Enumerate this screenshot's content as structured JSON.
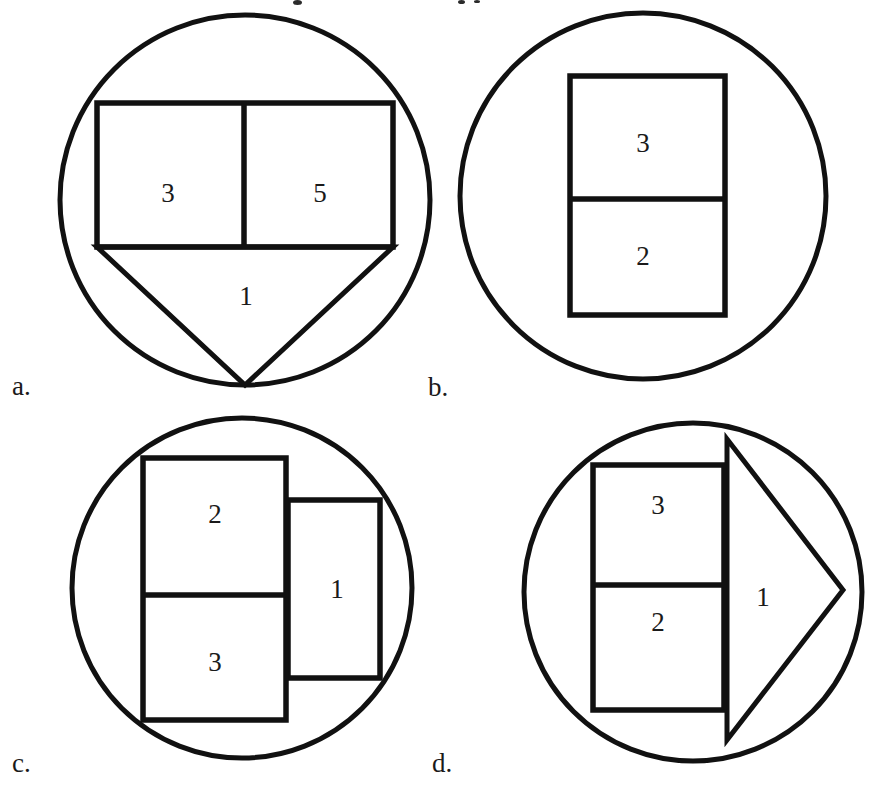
{
  "figure": {
    "background_color": "#ffffff",
    "stroke_color": "#111111",
    "text_color": "#1a1a1a"
  },
  "panels": [
    {
      "letter": "a.",
      "letter_pos": {
        "x": 12,
        "y": 395
      },
      "circle": {
        "cx": 245,
        "cy": 200,
        "r": 185
      },
      "shapes": [
        {
          "type": "rect",
          "x": 97,
          "y": 103,
          "w": 296,
          "h": 144
        },
        {
          "type": "vline",
          "x": 244,
          "y1": 103,
          "y2": 247
        },
        {
          "type": "triangle",
          "points": "97,247 393,247 245,385"
        }
      ],
      "regions": [
        {
          "label": "3",
          "x": 168,
          "y": 196
        },
        {
          "label": "5",
          "x": 320,
          "y": 196
        },
        {
          "label": "1",
          "x": 246,
          "y": 299
        }
      ]
    },
    {
      "letter": "b.",
      "letter_pos": {
        "x": 428,
        "y": 396
      },
      "circle": {
        "cx": 643,
        "cy": 196,
        "r": 183
      },
      "shapes": [
        {
          "type": "rect",
          "x": 570,
          "y": 76,
          "w": 155,
          "h": 239
        },
        {
          "type": "hline",
          "y": 199,
          "x1": 570,
          "x2": 725
        }
      ],
      "regions": [
        {
          "label": "3",
          "x": 643,
          "y": 146
        },
        {
          "label": "2",
          "x": 643,
          "y": 259
        }
      ]
    },
    {
      "letter": "c.",
      "letter_pos": {
        "x": 12,
        "y": 772
      },
      "circle": {
        "cx": 242,
        "cy": 588,
        "r": 170
      },
      "shapes": [
        {
          "type": "rect",
          "x": 288,
          "y": 500,
          "w": 92,
          "h": 178
        },
        {
          "type": "rect",
          "x": 143,
          "y": 458,
          "w": 143,
          "h": 262
        },
        {
          "type": "hline",
          "y": 595,
          "x1": 143,
          "x2": 286
        }
      ],
      "regions": [
        {
          "label": "2",
          "x": 215,
          "y": 517
        },
        {
          "label": "3",
          "x": 215,
          "y": 665
        },
        {
          "label": "1",
          "x": 337,
          "y": 592
        }
      ]
    },
    {
      "letter": "d.",
      "letter_pos": {
        "x": 432,
        "y": 772
      },
      "circle": {
        "cx": 693,
        "cy": 592,
        "r": 169
      },
      "shapes": [
        {
          "type": "triangle",
          "points": "727,439 727,740 843,590"
        },
        {
          "type": "rect",
          "x": 593,
          "y": 465,
          "w": 131,
          "h": 245
        },
        {
          "type": "hline",
          "y": 585,
          "x1": 593,
          "x2": 724
        }
      ],
      "regions": [
        {
          "label": "3",
          "x": 658,
          "y": 508
        },
        {
          "label": "2",
          "x": 658,
          "y": 625
        },
        {
          "label": "1",
          "x": 763,
          "y": 600
        }
      ]
    }
  ],
  "artifacts": {
    "note": "faint cropped ink marks from the line of text above the figure",
    "marks": [
      {
        "x": 293,
        "y": 0,
        "w": 9,
        "h": 5
      },
      {
        "x": 458,
        "y": 0,
        "w": 7,
        "h": 4
      },
      {
        "x": 474,
        "y": 0,
        "w": 6,
        "h": 3
      }
    ]
  }
}
